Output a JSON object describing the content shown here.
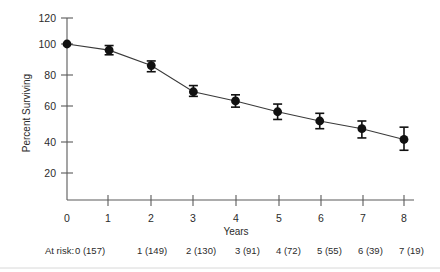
{
  "chart_data": {
    "type": "line",
    "title": "",
    "xlabel": "Years",
    "ylabel": "Percent Surviving",
    "x": [
      0,
      1,
      2,
      3,
      4,
      5,
      6,
      7,
      8
    ],
    "values": [
      100,
      96,
      86,
      69,
      63,
      56,
      50,
      45,
      38
    ],
    "error_low": [
      100,
      93,
      82,
      66,
      59,
      51,
      45,
      39,
      31
    ],
    "error_high": [
      100,
      99,
      89,
      73,
      67,
      61,
      55,
      50,
      46
    ],
    "xlim": [
      0,
      8
    ],
    "ylim": [
      0,
      120
    ],
    "ytick_labels": [
      "20",
      "40",
      "60",
      "80",
      "100",
      "120"
    ],
    "ytick_values": [
      20,
      40,
      60,
      80,
      100,
      120
    ],
    "xtick_labels": [
      "0",
      "1",
      "2",
      "3",
      "4",
      "5",
      "6",
      "7",
      "8"
    ],
    "grid": false,
    "legend": "none",
    "marker": "filled-circle",
    "error_bars": true
  },
  "axes": {
    "y_axis_title": "Percent Surviving",
    "x_axis_title": "Years"
  },
  "at_risk": {
    "prefix": "At risk:",
    "entries": [
      "0 (157)",
      "1 (149)",
      "2 (130)",
      "3 (91)",
      "4 (72)",
      "5 (55)",
      "6 (39)",
      "7 (19)",
      "8 (7)"
    ]
  },
  "colors": {
    "marker": "#111111",
    "line": "#3a3a3a",
    "axis": "#5a5a5a",
    "text": "#2b2b2b",
    "background": "#ffffff"
  }
}
